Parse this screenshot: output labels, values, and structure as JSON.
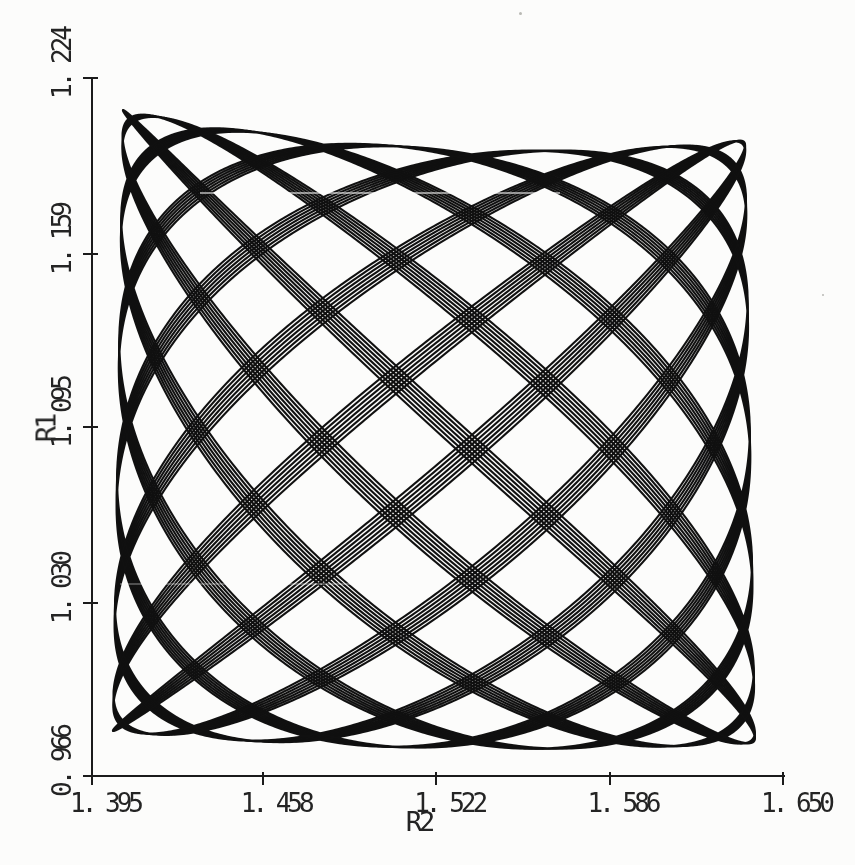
{
  "figure": {
    "background_color": "#fcfcfb",
    "ink_color": "#1b1b1b"
  },
  "chart_data": {
    "type": "line",
    "subtype": "quasiperiodic-trajectory-lissajous",
    "title": "",
    "xlabel": "R2",
    "ylabel": "R1",
    "xlim": [
      1.395,
      1.65
    ],
    "ylim": [
      0.966,
      1.224
    ],
    "grid": false,
    "legend": null,
    "x_ticks": [
      1.395,
      1.458,
      1.522,
      1.586,
      1.65
    ],
    "y_ticks": [
      0.966,
      1.03,
      1.095,
      1.159,
      1.224
    ],
    "x_tick_labels": [
      "1. 395",
      "1. 458",
      "1. 522",
      "1. 586",
      "1. 650"
    ],
    "y_tick_labels": [
      "0. 966",
      "1. 030",
      "1. 095",
      "1. 159",
      "1. 224"
    ],
    "trajectory": {
      "description": "Dense quasiperiodic (Lissajous-like) classical trajectory filling a slightly curved box; line bundles of ~4 passes form a diamond lattice with dark caustic edges.",
      "x_frequency": 14,
      "y_frequency": 13,
      "phase_x_rad": 3.14159265,
      "phase_y_rad": 0.0,
      "passes": 4,
      "pass_phase_step_rad": 0.016,
      "samples_per_pass": 12000,
      "R2_center": 1.5212,
      "R2_halfamp_vs_w": [
        0.11661,
        0.00185
      ],
      "R1_center_vs_u": [
        1.08721,
        -0.00389,
        0.0063
      ],
      "R1_halfamp_vs_u": [
        0.110835,
        -0.001668,
        0.002224
      ],
      "R2_range": [
        1.4053,
        1.6385
      ],
      "R1_range": [
        0.9764,
        1.2121
      ],
      "line_color": "#101010",
      "line_width_px": 2.1
    }
  }
}
